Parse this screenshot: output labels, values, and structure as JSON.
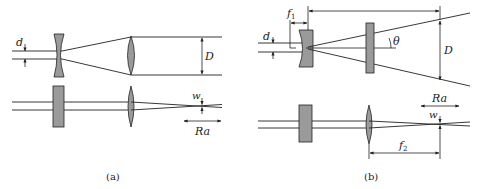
{
  "figure": {
    "panels": [
      {
        "id": "a",
        "caption": "(a)",
        "labels": {
          "beam_diameter_in": "d",
          "beam_diameter_out": "D",
          "waist": "w",
          "range": "Ra"
        }
      },
      {
        "id": "b",
        "caption": "(b)",
        "labels": {
          "focal_length_1": "f",
          "focal_length_1_sub": "1",
          "beam_diameter_in": "d",
          "divergence_angle": "θ",
          "beam_diameter_out": "D",
          "waist": "w",
          "range": "Ra",
          "focal_length_2": "f",
          "focal_length_2_sub": "2"
        }
      }
    ],
    "colors": {
      "line": "#222222",
      "optic_fill": "#9a9a9a",
      "background": "#ffffff"
    }
  }
}
